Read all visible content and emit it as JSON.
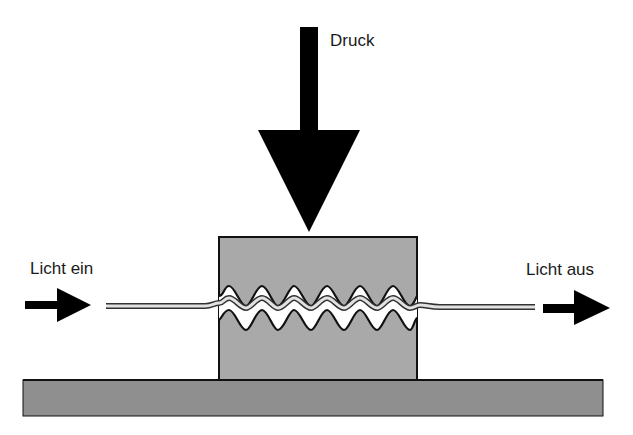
{
  "diagram": {
    "labels": {
      "pressure": "Druck",
      "light_in": "Licht ein",
      "light_out": "Licht aus"
    },
    "colors": {
      "block_fill": "#a9a9a9",
      "base_fill": "#8f8f8f",
      "arrow_fill": "#000000",
      "fiber_fill": "#d8d8d8",
      "outline": "#111111"
    },
    "elements": [
      "pressure-arrow",
      "pressure-block",
      "base-plate",
      "optical-fiber",
      "corrugated-upper-jaw",
      "corrugated-lower-jaw",
      "input-light-arrow",
      "output-light-arrow"
    ]
  }
}
